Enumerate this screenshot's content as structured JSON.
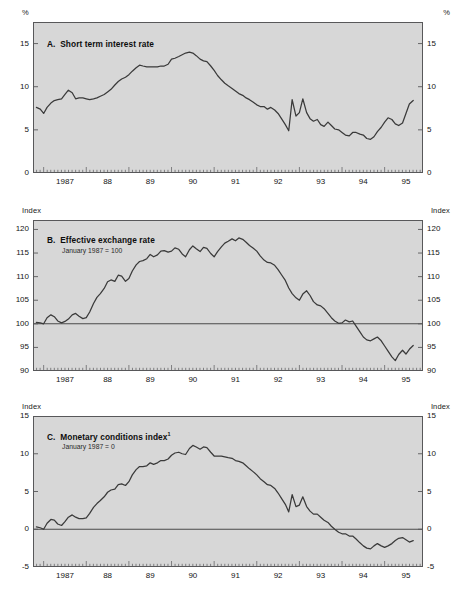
{
  "figure": {
    "background": "#ffffff",
    "plot_background": "#d7d7d7",
    "line_color": "#3a3a3a",
    "axis_color": "#58585a"
  },
  "panels": {
    "a": {
      "letter": "A.",
      "title": "Short term interest rate",
      "subtitle": "",
      "unit_left": "%",
      "unit_right": "%"
    },
    "b": {
      "letter": "B.",
      "title": "Effective exchange rate",
      "subtitle": "January 1987 = 100",
      "unit_left": "Index",
      "unit_right": "Index"
    },
    "c": {
      "letter": "C.",
      "title": "Monetary conditions index",
      "footnote_marker": "1",
      "subtitle": "January 1987 = 0",
      "unit_left": "Index",
      "unit_right": "Index"
    }
  },
  "chart_data": [
    {
      "type": "line",
      "id": "panel-a",
      "title": "A.  Short term interest rate",
      "xlabel": "",
      "ylabel": "%",
      "ylim": [
        0,
        17.5
      ],
      "yticks": [
        0,
        5,
        10,
        15
      ],
      "ytick_labels": [
        "0",
        "5",
        "10",
        "15"
      ],
      "xlim": [
        1986.75,
        1995.9
      ],
      "xticks": [
        1987,
        1988,
        1989,
        1990,
        1991,
        1992,
        1993,
        1994,
        1995
      ],
      "xtick_labels": [
        "1987",
        "88",
        "89",
        "90",
        "91",
        "92",
        "93",
        "94",
        "95"
      ],
      "minor_tick_interval_months": 1,
      "grid": false,
      "legend": "none",
      "x": [
        1986.83,
        1986.92,
        1987.0,
        1987.08,
        1987.17,
        1987.25,
        1987.33,
        1987.42,
        1987.5,
        1987.58,
        1987.67,
        1987.75,
        1987.83,
        1987.92,
        1988.0,
        1988.08,
        1988.17,
        1988.25,
        1988.33,
        1988.42,
        1988.5,
        1988.58,
        1988.67,
        1988.75,
        1988.83,
        1988.92,
        1989.0,
        1989.08,
        1989.17,
        1989.25,
        1989.33,
        1989.42,
        1989.5,
        1989.58,
        1989.67,
        1989.75,
        1989.83,
        1989.92,
        1990.0,
        1990.08,
        1990.17,
        1990.25,
        1990.33,
        1990.42,
        1990.5,
        1990.58,
        1990.67,
        1990.75,
        1990.83,
        1990.92,
        1991.0,
        1991.08,
        1991.17,
        1991.25,
        1991.33,
        1991.42,
        1991.5,
        1991.58,
        1991.67,
        1991.75,
        1991.83,
        1991.92,
        1992.0,
        1992.08,
        1992.17,
        1992.25,
        1992.33,
        1992.42,
        1992.5,
        1992.58,
        1992.67,
        1992.75,
        1992.83,
        1992.92,
        1993.0,
        1993.08,
        1993.17,
        1993.25,
        1993.33,
        1993.42,
        1993.5,
        1993.58,
        1993.67,
        1993.75,
        1993.83,
        1993.92,
        1994.0,
        1994.08,
        1994.17,
        1994.25,
        1994.33,
        1994.42,
        1994.5,
        1994.58,
        1994.67,
        1994.75,
        1994.83,
        1994.92,
        1995.0,
        1995.08,
        1995.17,
        1995.25,
        1995.33,
        1995.42,
        1995.5,
        1995.58,
        1995.67
      ],
      "y": [
        7.6,
        7.4,
        6.9,
        7.6,
        8.1,
        8.4,
        8.5,
        8.6,
        9.1,
        9.6,
        9.3,
        8.6,
        8.7,
        8.7,
        8.6,
        8.5,
        8.6,
        8.7,
        8.9,
        9.1,
        9.4,
        9.7,
        10.2,
        10.6,
        10.9,
        11.1,
        11.4,
        11.8,
        12.2,
        12.5,
        12.4,
        12.3,
        12.3,
        12.3,
        12.3,
        12.4,
        12.4,
        12.6,
        13.2,
        13.3,
        13.5,
        13.7,
        13.9,
        14.0,
        13.9,
        13.6,
        13.2,
        13.0,
        12.9,
        12.4,
        11.9,
        11.3,
        10.8,
        10.4,
        10.1,
        9.8,
        9.5,
        9.2,
        9.0,
        8.7,
        8.5,
        8.2,
        7.9,
        7.7,
        7.7,
        7.4,
        7.6,
        7.3,
        6.9,
        6.3,
        5.6,
        4.9,
        8.5,
        6.6,
        7.0,
        8.6,
        7.0,
        6.3,
        6.0,
        6.2,
        5.6,
        5.4,
        5.9,
        5.5,
        5.1,
        5.0,
        4.7,
        4.4,
        4.3,
        4.7,
        4.7,
        4.5,
        4.4,
        4.0,
        3.9,
        4.2,
        4.8,
        5.3,
        5.9,
        6.4,
        6.2,
        5.7,
        5.5,
        5.8,
        6.9,
        8.0,
        8.4
      ]
    },
    {
      "type": "line",
      "id": "panel-b",
      "title": "B.  Effective exchange rate",
      "subtitle": "January 1987 = 100",
      "xlabel": "",
      "ylabel": "Index",
      "ylim": [
        90,
        122
      ],
      "yticks": [
        90,
        95,
        100,
        105,
        110,
        115,
        120
      ],
      "ytick_labels": [
        "90",
        "95",
        "100",
        "105",
        "110",
        "115",
        "120"
      ],
      "xlim": [
        1986.75,
        1995.9
      ],
      "xticks": [
        1987,
        1988,
        1989,
        1990,
        1991,
        1992,
        1993,
        1994,
        1995
      ],
      "xtick_labels": [
        "1987",
        "88",
        "89",
        "90",
        "91",
        "92",
        "93",
        "94",
        "95"
      ],
      "reference_line": 100,
      "grid": false,
      "legend": "none",
      "x": [
        1986.83,
        1986.92,
        1987.0,
        1987.08,
        1987.17,
        1987.25,
        1987.33,
        1987.42,
        1987.5,
        1987.58,
        1987.67,
        1987.75,
        1987.83,
        1987.92,
        1988.0,
        1988.08,
        1988.17,
        1988.25,
        1988.33,
        1988.42,
        1988.5,
        1988.58,
        1988.67,
        1988.75,
        1988.83,
        1988.92,
        1989.0,
        1989.08,
        1989.17,
        1989.25,
        1989.33,
        1989.42,
        1989.5,
        1989.58,
        1989.67,
        1989.75,
        1989.83,
        1989.92,
        1990.0,
        1990.08,
        1990.17,
        1990.25,
        1990.33,
        1990.42,
        1990.5,
        1990.58,
        1990.67,
        1990.75,
        1990.83,
        1990.92,
        1991.0,
        1991.08,
        1991.17,
        1991.25,
        1991.33,
        1991.42,
        1991.5,
        1991.58,
        1991.67,
        1991.75,
        1991.83,
        1991.92,
        1992.0,
        1992.08,
        1992.17,
        1992.25,
        1992.33,
        1992.42,
        1992.5,
        1992.58,
        1992.67,
        1992.75,
        1992.83,
        1992.92,
        1993.0,
        1993.08,
        1993.17,
        1993.25,
        1993.33,
        1993.42,
        1993.5,
        1993.58,
        1993.67,
        1993.75,
        1993.83,
        1993.92,
        1994.0,
        1994.08,
        1994.17,
        1994.25,
        1994.33,
        1994.42,
        1994.5,
        1994.58,
        1994.67,
        1994.75,
        1994.83,
        1994.92,
        1995.0,
        1995.08,
        1995.17,
        1995.25,
        1995.33,
        1995.42,
        1995.5,
        1995.58,
        1995.67
      ],
      "y": [
        100.3,
        100.2,
        100.0,
        101.3,
        101.9,
        101.5,
        100.6,
        100.2,
        100.5,
        101.0,
        101.9,
        102.2,
        101.6,
        101.1,
        101.3,
        102.5,
        104.3,
        105.6,
        106.4,
        107.5,
        108.9,
        109.3,
        109.0,
        110.3,
        110.1,
        109.0,
        109.6,
        111.2,
        112.5,
        113.2,
        113.4,
        113.8,
        114.7,
        114.2,
        114.6,
        115.4,
        115.5,
        115.2,
        115.4,
        116.1,
        115.8,
        114.8,
        114.2,
        115.7,
        116.5,
        115.9,
        115.3,
        116.2,
        116.0,
        114.9,
        114.2,
        115.3,
        116.3,
        117.1,
        117.5,
        118.0,
        117.6,
        118.2,
        117.9,
        117.3,
        116.6,
        116.0,
        115.4,
        114.4,
        113.5,
        113.0,
        112.9,
        112.4,
        111.5,
        110.4,
        109.2,
        107.6,
        106.4,
        105.5,
        105.0,
        106.3,
        107.0,
        106.0,
        104.7,
        104.0,
        103.8,
        103.2,
        102.2,
        101.3,
        100.6,
        100.1,
        100.2,
        100.8,
        100.4,
        100.6,
        99.5,
        98.3,
        97.2,
        96.6,
        96.4,
        96.8,
        97.2,
        96.4,
        95.3,
        94.2,
        93.0,
        92.2,
        93.5,
        94.4,
        93.6,
        94.6,
        95.4
      ]
    },
    {
      "type": "line",
      "id": "panel-c",
      "title": "C.  Monetary conditions index",
      "subtitle": "January 1987 = 0",
      "xlabel": "",
      "ylabel": "Index",
      "ylim": [
        -5,
        15
      ],
      "yticks": [
        -5,
        0,
        5,
        10,
        15
      ],
      "ytick_labels": [
        "-5",
        "0",
        "5",
        "10",
        "15"
      ],
      "xlim": [
        1986.75,
        1995.9
      ],
      "xticks": [
        1987,
        1988,
        1989,
        1990,
        1991,
        1992,
        1993,
        1994,
        1995
      ],
      "xtick_labels": [
        "1987",
        "88",
        "89",
        "90",
        "91",
        "92",
        "93",
        "94",
        "95"
      ],
      "reference_line": 0,
      "grid": false,
      "legend": "none",
      "x": [
        1986.83,
        1986.92,
        1987.0,
        1987.08,
        1987.17,
        1987.25,
        1987.33,
        1987.42,
        1987.5,
        1987.58,
        1987.67,
        1987.75,
        1987.83,
        1987.92,
        1988.0,
        1988.08,
        1988.17,
        1988.25,
        1988.33,
        1988.42,
        1988.5,
        1988.58,
        1988.67,
        1988.75,
        1988.83,
        1988.92,
        1989.0,
        1989.08,
        1989.17,
        1989.25,
        1989.33,
        1989.42,
        1989.5,
        1989.58,
        1989.67,
        1989.75,
        1989.83,
        1989.92,
        1990.0,
        1990.08,
        1990.17,
        1990.25,
        1990.33,
        1990.42,
        1990.5,
        1990.58,
        1990.67,
        1990.75,
        1990.83,
        1990.92,
        1991.0,
        1991.08,
        1991.17,
        1991.25,
        1991.33,
        1991.42,
        1991.5,
        1991.58,
        1991.67,
        1991.75,
        1991.83,
        1991.92,
        1992.0,
        1992.08,
        1992.17,
        1992.25,
        1992.33,
        1992.42,
        1992.5,
        1992.58,
        1992.67,
        1992.75,
        1992.83,
        1992.92,
        1993.0,
        1993.08,
        1993.17,
        1993.25,
        1993.33,
        1993.42,
        1993.5,
        1993.58,
        1993.67,
        1993.75,
        1993.83,
        1993.92,
        1994.0,
        1994.08,
        1994.17,
        1994.25,
        1994.33,
        1994.42,
        1994.5,
        1994.58,
        1994.67,
        1994.75,
        1994.83,
        1994.92,
        1995.0,
        1995.08,
        1995.17,
        1995.25,
        1995.33,
        1995.42,
        1995.5,
        1995.58,
        1995.67
      ],
      "y": [
        0.3,
        0.2,
        0.0,
        0.8,
        1.3,
        1.2,
        0.7,
        0.5,
        1.0,
        1.6,
        1.9,
        1.6,
        1.4,
        1.4,
        1.5,
        2.1,
        2.9,
        3.4,
        3.8,
        4.3,
        4.9,
        5.2,
        5.3,
        5.9,
        6.0,
        5.8,
        6.3,
        7.2,
        7.9,
        8.3,
        8.3,
        8.4,
        8.8,
        8.6,
        8.8,
        9.1,
        9.1,
        9.3,
        9.8,
        10.1,
        10.2,
        10.0,
        9.9,
        10.7,
        11.1,
        10.9,
        10.6,
        10.9,
        10.8,
        10.2,
        9.7,
        9.7,
        9.7,
        9.6,
        9.5,
        9.4,
        9.1,
        9.0,
        8.8,
        8.4,
        8.0,
        7.6,
        7.2,
        6.7,
        6.3,
        5.9,
        5.8,
        5.4,
        4.8,
        4.1,
        3.3,
        2.3,
        4.6,
        3.0,
        3.2,
        4.3,
        3.0,
        2.4,
        2.0,
        2.0,
        1.6,
        1.2,
        0.9,
        0.4,
        0.0,
        -0.4,
        -0.6,
        -0.6,
        -0.9,
        -0.9,
        -1.3,
        -1.8,
        -2.2,
        -2.5,
        -2.6,
        -2.2,
        -1.9,
        -2.2,
        -2.4,
        -2.2,
        -1.9,
        -1.5,
        -1.2,
        -1.1,
        -1.4,
        -1.7,
        -1.5
      ]
    }
  ]
}
